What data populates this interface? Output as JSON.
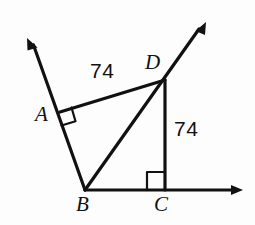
{
  "figure": {
    "background_color": "#fdfdfd",
    "stroke_color": "#111111",
    "vertices": [
      {
        "id": "A",
        "label": "A",
        "x": 60,
        "y": 112
      },
      {
        "id": "B",
        "label": "B",
        "x": 85,
        "y": 190
      },
      {
        "id": "C",
        "label": "C",
        "x": 165,
        "y": 190
      },
      {
        "id": "D",
        "label": "D",
        "x": 165,
        "y": 80
      }
    ],
    "measurements": [
      {
        "id": "AD",
        "value": "74",
        "segment": "A-D"
      },
      {
        "id": "DC",
        "value": "74",
        "segment": "D-C"
      }
    ],
    "right_angles": [
      {
        "id": "angle-at-A",
        "at": "A"
      },
      {
        "id": "angle-at-C",
        "at": "C"
      }
    ],
    "rays": [
      {
        "id": "ray-BA",
        "from": "B",
        "through": "A",
        "arrow_tip_x": 27,
        "arrow_tip_y": 38
      },
      {
        "id": "ray-BC",
        "from": "B",
        "through": "C",
        "arrow_tip_x": 243,
        "arrow_tip_y": 190
      },
      {
        "id": "ray-BD",
        "from": "B",
        "through": "D",
        "arrow_tip_x": 206,
        "arrow_tip_y": 22
      }
    ],
    "segments": [
      {
        "id": "seg-AD",
        "from": "A",
        "to": "D"
      },
      {
        "id": "seg-DC",
        "from": "D",
        "to": "C"
      }
    ]
  }
}
